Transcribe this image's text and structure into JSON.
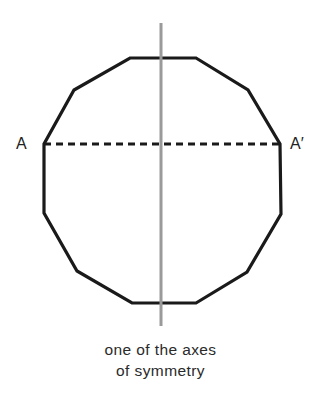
{
  "diagram": {
    "shape": "regular dodecagon",
    "vertex_labels": {
      "left": "A",
      "right": "A′"
    },
    "caption": {
      "line1": "one of the axes",
      "line2": "of symmetry"
    },
    "colors": {
      "outline": "#1a1a1a",
      "axis": "#999999",
      "dashed": "#1a1a1a",
      "text": "#2a2a2a"
    }
  }
}
